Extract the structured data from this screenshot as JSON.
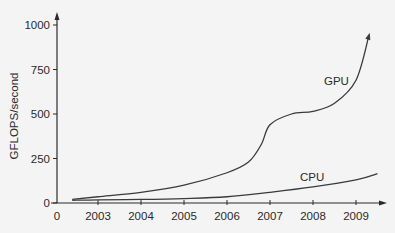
{
  "chart_data": {
    "type": "line",
    "title": "",
    "xlabel": "",
    "ylabel": "GFLOPS/second",
    "xlim": [
      2002,
      2009.7
    ],
    "ylim": [
      0,
      1000
    ],
    "x_ticks": [
      "0",
      "2003",
      "2004",
      "2005",
      "2006",
      "2007",
      "2008",
      "2009"
    ],
    "y_ticks": [
      "0",
      "250",
      "500",
      "750",
      "1000"
    ],
    "grid": false,
    "legend": "inline labels",
    "series": [
      {
        "name": "GPU",
        "x": [
          2002.4,
          2003,
          2004,
          2005,
          2006,
          2006.5,
          2006.8,
          2007,
          2007.5,
          2008,
          2008.5,
          2009,
          2009.3
        ],
        "values": [
          20,
          35,
          60,
          100,
          170,
          230,
          330,
          440,
          500,
          515,
          560,
          690,
          940
        ]
      },
      {
        "name": "CPU",
        "x": [
          2002.4,
          2003,
          2004,
          2005,
          2006,
          2007,
          2008,
          2009,
          2009.5
        ],
        "values": [
          15,
          18,
          20,
          25,
          35,
          60,
          90,
          130,
          165
        ]
      }
    ]
  },
  "axes": {
    "ylabel": "GFLOPS/second",
    "x_ticks": [
      "0",
      "2003",
      "2004",
      "2005",
      "2006",
      "2007",
      "2008",
      "2009"
    ],
    "y_ticks": [
      "0",
      "250",
      "500",
      "750",
      "1000"
    ]
  },
  "labels": {
    "gpu": "GPU",
    "cpu": "CPU"
  },
  "colors": {
    "line": "#3a3a3a",
    "axis": "#2a2a2a",
    "background": "#f4f4f4"
  }
}
